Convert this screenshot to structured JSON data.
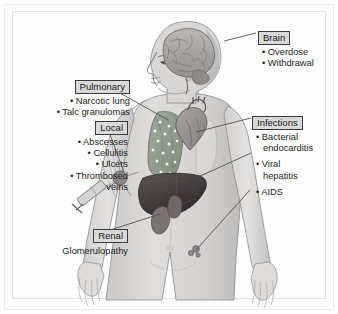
{
  "figure": {
    "frame_color": "#e2e2e3",
    "label_box_fill": "#d9d9d9",
    "label_box_border": "#3a3a3a",
    "text_color": "#231f20",
    "leader_line_color": "#4a4a4a"
  },
  "callouts": {
    "brain": {
      "label": "Brain",
      "items": [
        "• Overdose",
        "• Withdrawal"
      ]
    },
    "pulmonary": {
      "label": "Pulmonary",
      "items": [
        "• Narcotic lung",
        "• Talc granulomas"
      ]
    },
    "local": {
      "label": "Local",
      "items": [
        "• Abscesses",
        "• Cellulitis",
        "• Ulcers",
        "• Thrombosed",
        "veins"
      ]
    },
    "renal": {
      "label": "Renal",
      "items": [
        "Glomerulopathy"
      ]
    },
    "infections": {
      "label": "Infections",
      "items": [
        "• Bacterial",
        "endocarditis",
        "• Viral",
        "hepatitis",
        "• AIDS"
      ]
    }
  },
  "anatomy": {
    "figure_name": "human-male-torso-figure",
    "parts": [
      {
        "name": "brain",
        "color": "#a9a9a9"
      },
      {
        "name": "head-profile",
        "color": "#d6d4d2"
      },
      {
        "name": "lung",
        "color": "#8e9a8c"
      },
      {
        "name": "talc-granuloma-speckles",
        "color": "#f2f2ee"
      },
      {
        "name": "heart",
        "color": "#9b9596"
      },
      {
        "name": "liver",
        "color": "#4a4344"
      },
      {
        "name": "kidney",
        "color": "#7d7374"
      },
      {
        "name": "syringe",
        "color": "#cfcfcf"
      },
      {
        "name": "injection-site",
        "color": "#8a8487"
      },
      {
        "name": "lymph-node-groin",
        "color": "#8d8789"
      },
      {
        "name": "body-skin",
        "color": "#d8d6d4"
      }
    ]
  }
}
